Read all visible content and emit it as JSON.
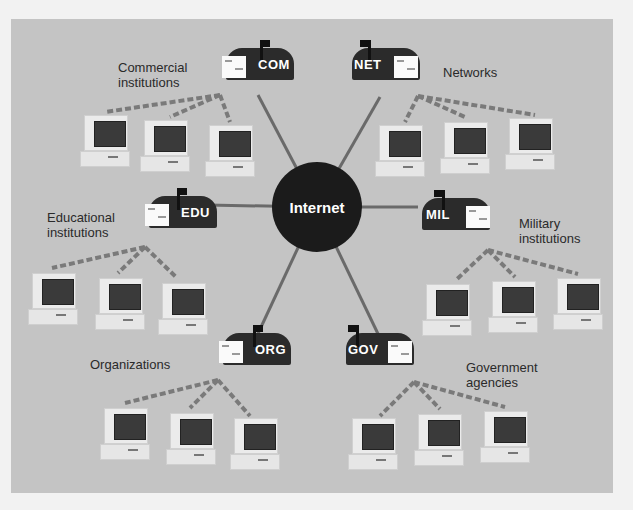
{
  "diagram": {
    "hub": {
      "label": "Internet"
    },
    "domains": [
      {
        "id": "com",
        "mailbox_label": "COM",
        "description": "Commercial\ninstitutions",
        "computers": 3
      },
      {
        "id": "net",
        "mailbox_label": "NET",
        "description": "Networks",
        "computers": 3
      },
      {
        "id": "edu",
        "mailbox_label": "EDU",
        "description": "Educational\ninstitutions",
        "computers": 3
      },
      {
        "id": "mil",
        "mailbox_label": "MIL",
        "description": "Military\ninstitutions",
        "computers": 3
      },
      {
        "id": "org",
        "mailbox_label": "ORG",
        "description": "Organizations",
        "computers": 3
      },
      {
        "id": "gov",
        "mailbox_label": "GOV",
        "description": "Government\nagencies",
        "computers": 3
      }
    ],
    "colors": {
      "background": "#c4c4c4",
      "hub": "#1b1b1b",
      "mailbox": "#2b2b2b",
      "link_line": "#6a6a6a",
      "dashed_link": "#7a7a7a"
    }
  }
}
